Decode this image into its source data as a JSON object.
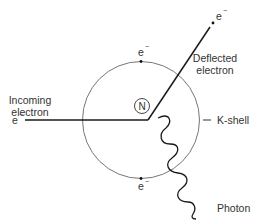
{
  "diagram": {
    "type": "bremsstrahlung-interaction",
    "labels": {
      "incoming_electron": [
        "Incoming",
        "electron"
      ],
      "deflected_electron": [
        "Deflected",
        "electron"
      ],
      "k_shell": "K-shell",
      "photon": "Photon",
      "nucleus": "N",
      "electron_symbol": "e",
      "electron_charge": "−"
    },
    "colors": {
      "line": "#1a1a1a",
      "shell": "#555555",
      "text": "#333333",
      "background": "#ffffff"
    }
  }
}
